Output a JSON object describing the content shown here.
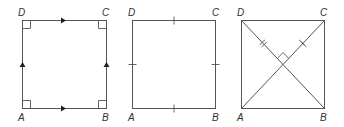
{
  "figure": {
    "stroke_color": "#555555",
    "label_color": "#333333",
    "squares": [
      {
        "id": "parallel-sides-right-angles",
        "labels": {
          "A": "A",
          "B": "B",
          "C": "C",
          "D": "D"
        },
        "features": [
          "right-angle markers at all four corners",
          "arrow marks showing AB parallel to DC",
          "arrow marks showing AD parallel to BC"
        ]
      },
      {
        "id": "equal-sides",
        "labels": {
          "A": "A",
          "B": "B",
          "C": "C",
          "D": "D"
        },
        "features": [
          "single tick mark on each side indicating equal lengths"
        ]
      },
      {
        "id": "diagonals",
        "labels": {
          "A": "A",
          "B": "B",
          "C": "C",
          "D": "D"
        },
        "features": [
          "diagonals AC and BD",
          "right-angle marker at intersection",
          "double tick marks on upper halves of diagonals"
        ]
      }
    ]
  }
}
